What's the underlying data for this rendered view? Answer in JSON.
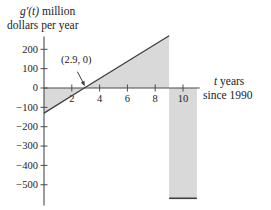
{
  "figure": {
    "y_axis_title": {
      "variable": "g′(t)",
      "suffix": " million",
      "line2": "dollars per year"
    },
    "x_axis_title": {
      "variable": "t",
      "suffix": " years",
      "line2": "since 1990"
    },
    "annotation_label": "(2.9, 0)"
  },
  "colors": {
    "shade_fill": "#d9d9d9",
    "curve_line": "#3d3d3d",
    "axis_line": "#4a4a4a",
    "text": "#1b1b1b"
  },
  "chart_data": {
    "type": "area",
    "xlabel": "t years since 1990",
    "ylabel": "g′(t) million dollars per year",
    "xlim": [
      0,
      11.2
    ],
    "ylim": [
      -600,
      300
    ],
    "x_ticks": [
      2,
      4,
      6,
      8,
      10
    ],
    "y_ticks": [
      200,
      100,
      0,
      -100,
      -200,
      -300,
      -400,
      -500
    ],
    "grid": false,
    "legend": false,
    "series": [
      {
        "name": "g-prime-linear-segment",
        "x": [
          0,
          2.9,
          9
        ],
        "y": [
          -130,
          0,
          270
        ]
      },
      {
        "name": "g-prime-constant-segment",
        "x": [
          9,
          11
        ],
        "y": [
          -570,
          -570
        ]
      }
    ],
    "annotations": [
      {
        "text": "(2.9, 0)",
        "point": [
          2.9,
          0
        ]
      }
    ],
    "shaded_regions": [
      {
        "region": "between curve and t-axis",
        "from_t": 0,
        "to_t": 2.9,
        "sign": "negative"
      },
      {
        "region": "between curve and t-axis",
        "from_t": 2.9,
        "to_t": 9,
        "sign": "positive"
      },
      {
        "region": "between curve and t-axis",
        "from_t": 9,
        "to_t": 11,
        "sign": "negative"
      }
    ]
  }
}
